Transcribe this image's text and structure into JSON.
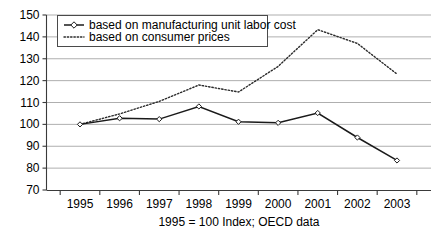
{
  "chart_data": {
    "type": "line",
    "title": "",
    "subtitle": "",
    "xlabel": "1995 = 100 Index; OECD data",
    "ylabel": "",
    "categories": [
      "1995",
      "1996",
      "1997",
      "1998",
      "1999",
      "2000",
      "2001",
      "2002",
      "2003"
    ],
    "x": [
      1995,
      1996,
      1997,
      1998,
      1999,
      2000,
      2001,
      2002,
      2003
    ],
    "xlim": [
      1995,
      2003
    ],
    "ylim": [
      70,
      150
    ],
    "y_ticks": [
      70,
      80,
      90,
      100,
      110,
      120,
      130,
      140,
      150
    ],
    "y_tick_labels": [
      "70",
      "80",
      "90",
      "100",
      "110",
      "120",
      "130",
      "140",
      "150"
    ],
    "grid": true,
    "legend_position": "top-left",
    "series": [
      {
        "name": "based on manufacturing unit labor cost",
        "style": "solid-with-open-diamond-markers",
        "color": "#1a1a1a",
        "values": [
          100.0,
          102.8,
          102.4,
          108.2,
          101.2,
          100.7,
          105.2,
          94.0,
          83.5
        ]
      },
      {
        "name": "based on consumer prices",
        "style": "dotted",
        "color": "#2b2b2b",
        "values": [
          100.0,
          104.8,
          110.5,
          118.0,
          114.8,
          126.5,
          143.3,
          137.0,
          123.0
        ]
      }
    ],
    "annotations": []
  },
  "caption": {
    "text": "1995 = 100 Index; OECD data"
  },
  "legend": {
    "entries": [
      {
        "label": "based on manufacturing unit labor cost",
        "marker": "line-diamond-marker"
      },
      {
        "label": "based on consumer prices",
        "marker": "dotted-line-marker"
      }
    ]
  },
  "colors": {
    "background": "#ffffff",
    "gridline": "#9a9a9a",
    "axis": "#3a3a3a",
    "series_solid": "#1a1a1a",
    "series_dotted": "#2b2b2b",
    "text": "#000000"
  }
}
